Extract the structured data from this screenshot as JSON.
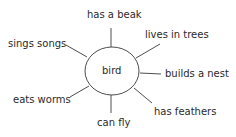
{
  "diagram": {
    "type": "mind-map",
    "center": {
      "label": "bird"
    },
    "branches": [
      {
        "label": "has a beak"
      },
      {
        "label": "lives in trees"
      },
      {
        "label": "builds a nest"
      },
      {
        "label": "has feathers"
      },
      {
        "label": "can fly"
      },
      {
        "label": "eats worms"
      },
      {
        "label": "sings songs"
      }
    ],
    "colors": {
      "line": "#3a3a3a",
      "text": "#2a2a2a",
      "background": "#ffffff"
    }
  }
}
